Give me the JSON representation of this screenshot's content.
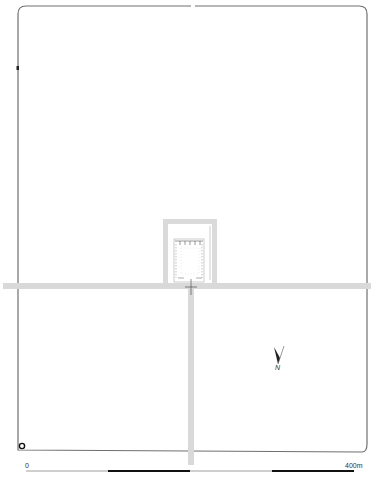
{
  "map": {
    "type": "site plan",
    "colors": {
      "wall": "#6e6e6e",
      "road": "#d9d9d9",
      "detail": "#8a8a8a",
      "background": "#ffffff"
    }
  },
  "north_arrow": {
    "label": "N",
    "icon": "north-arrow-icon"
  },
  "scale_bar": {
    "start_label": "0",
    "end_label": "400m",
    "segments": 4
  }
}
